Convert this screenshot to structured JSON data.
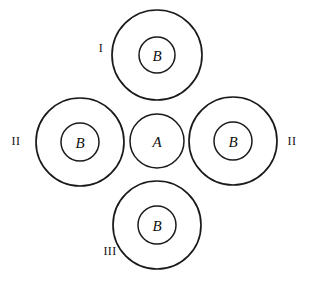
{
  "figure": {
    "background_color": "#ffffff",
    "stroke_color": "#1a1a1a",
    "width": 310,
    "height": 294,
    "core": {
      "label": "A",
      "cx": 157,
      "cy": 141,
      "r": 27
    },
    "rings": [
      {
        "id": "ring-top",
        "label": "B",
        "position": "top",
        "cx": 157,
        "cy": 55,
        "outer_r": 45,
        "inner_r": 18,
        "roman": {
          "text": "I",
          "x": 101,
          "y": 48
        }
      },
      {
        "id": "ring-left",
        "label": "B",
        "position": "left",
        "cx": 80,
        "cy": 142,
        "outer_r": 44,
        "inner_r": 19,
        "roman": {
          "text": "II",
          "x": 16,
          "y": 141
        }
      },
      {
        "id": "ring-right",
        "label": "B",
        "position": "right",
        "cx": 233,
        "cy": 141,
        "outer_r": 44,
        "inner_r": 19,
        "roman": {
          "text": "II",
          "x": 292,
          "y": 141
        }
      },
      {
        "id": "ring-bottom",
        "label": "B",
        "position": "bottom",
        "cx": 157,
        "cy": 225,
        "outer_r": 44,
        "inner_r": 19,
        "roman": {
          "text": "III",
          "x": 110,
          "y": 251
        }
      }
    ]
  }
}
